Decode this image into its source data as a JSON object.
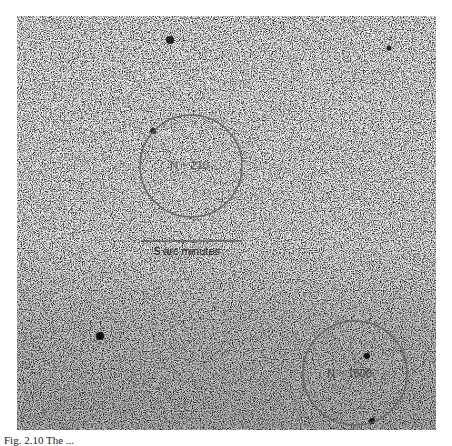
{
  "figure": {
    "background_color": "#d8d8d8",
    "circles": [
      {
        "id": "sparse-region",
        "label": "N ~ 210",
        "cx": 191,
        "cy": 166,
        "r": 51,
        "stroke": "#666666"
      },
      {
        "id": "dense-region",
        "label": "N ~ 1600",
        "cx": 355,
        "cy": 373,
        "r": 52,
        "stroke": "#666666"
      }
    ],
    "scale_bar": {
      "label": "5 arc minutes",
      "x1": 141,
      "x2": 242,
      "y": 241
    }
  },
  "caption": {
    "text": "Fig. 2.10  The ..."
  }
}
